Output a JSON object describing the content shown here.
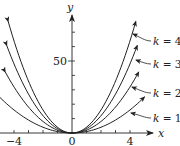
{
  "chart_data": {
    "type": "line",
    "title": "",
    "xlabel": "x",
    "ylabel": "y",
    "xlim": [
      -5,
      5.5
    ],
    "ylim": [
      0,
      80
    ],
    "x_ticks": [
      -4,
      -3,
      -2,
      -1,
      0,
      1,
      2,
      3,
      4
    ],
    "x_tick_labels": [
      "-4",
      "0",
      "4"
    ],
    "x_tick_label_values": [
      -4,
      0,
      4
    ],
    "y_ticks": [
      10,
      20,
      30,
      40,
      50,
      60,
      70
    ],
    "y_tick_labels": [
      "50"
    ],
    "y_tick_label_values": [
      50
    ],
    "grid": false,
    "formula": "y = k x^2",
    "series": [
      {
        "name": "k = 1",
        "k": 1,
        "x_range": [
          -5.0,
          5.0
        ],
        "points": [
          [
            -5,
            25
          ],
          [
            -4,
            16
          ],
          [
            -3,
            9
          ],
          [
            -2,
            4
          ],
          [
            -1,
            1
          ],
          [
            0,
            0
          ],
          [
            1,
            1
          ],
          [
            2,
            4
          ],
          [
            3,
            9
          ],
          [
            4,
            16
          ],
          [
            5,
            25
          ]
        ]
      },
      {
        "name": "k = 2",
        "k": 2,
        "x_range": [
          -4.6,
          4.6
        ],
        "points": [
          [
            -4.6,
            42.3
          ],
          [
            -4,
            32
          ],
          [
            -3,
            18
          ],
          [
            -2,
            8
          ],
          [
            -1,
            2
          ],
          [
            0,
            0
          ],
          [
            1,
            2
          ],
          [
            2,
            8
          ],
          [
            3,
            18
          ],
          [
            4,
            32
          ],
          [
            4.6,
            42.3
          ]
        ]
      },
      {
        "name": "k = 3",
        "k": 3,
        "x_range": [
          -4.5,
          4.5
        ],
        "points": [
          [
            -4.5,
            60.8
          ],
          [
            -4,
            48
          ],
          [
            -3,
            27
          ],
          [
            -2,
            12
          ],
          [
            -1,
            3
          ],
          [
            0,
            0
          ],
          [
            1,
            3
          ],
          [
            2,
            12
          ],
          [
            3,
            27
          ],
          [
            4,
            48
          ],
          [
            4.5,
            60.8
          ]
        ]
      },
      {
        "name": "k = 4",
        "k": 4,
        "x_range": [
          -4.4,
          4.4
        ],
        "points": [
          [
            -4.4,
            77.4
          ],
          [
            -4,
            64
          ],
          [
            -3,
            36
          ],
          [
            -2,
            16
          ],
          [
            -1,
            4
          ],
          [
            0,
            0
          ],
          [
            1,
            4
          ],
          [
            2,
            16
          ],
          [
            3,
            36
          ],
          [
            4,
            64
          ],
          [
            4.4,
            77.4
          ]
        ]
      }
    ],
    "annotations": [
      {
        "text": "k = 4",
        "points_to": "k = 4"
      },
      {
        "text": "k = 3",
        "points_to": "k = 3"
      },
      {
        "text": "k = 2",
        "points_to": "k = 2"
      },
      {
        "text": "k = 1",
        "points_to": "k = 1"
      }
    ],
    "legend_position": "right, inline labels with pointer arrows"
  },
  "axes": {
    "x_label": "x",
    "y_label": "y",
    "x_tick_left": "−4",
    "x_tick_origin": "0",
    "x_tick_right": "4",
    "y_tick_50": "50"
  },
  "labels": {
    "k4": {
      "var": "k",
      "eq": " = 4"
    },
    "k3": {
      "var": "k",
      "eq": " = 3"
    },
    "k2": {
      "var": "k",
      "eq": " = 2"
    },
    "k1": {
      "var": "k",
      "eq": " = 1"
    }
  },
  "colors": {
    "ink": "#222222",
    "background": "#ffffff"
  }
}
